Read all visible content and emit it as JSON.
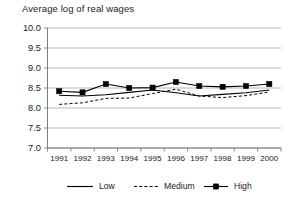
{
  "chart_data": {
    "type": "line",
    "title": "Average log of real wages",
    "xlabel": "",
    "ylabel": "",
    "categories": [
      "1991",
      "1992",
      "1993",
      "1994",
      "1995",
      "1996",
      "1997",
      "1998",
      "1999",
      "2000"
    ],
    "x": [
      1991,
      1992,
      1993,
      1994,
      1995,
      1996,
      1997,
      1998,
      1999,
      2000
    ],
    "ylim": [
      7.0,
      10.0
    ],
    "ytick_labels": [
      "10.0",
      "9.5",
      "9.0",
      "8.5",
      "8.0",
      "7.5",
      "7.0"
    ],
    "ytick_values": [
      10.0,
      9.5,
      9.0,
      8.5,
      8.0,
      7.5,
      7.0
    ],
    "grid": true,
    "legend_position": "bottom",
    "series": [
      {
        "name": "Low",
        "style": "solid",
        "marker": "none",
        "color": "#000000",
        "values": [
          8.32,
          8.3,
          8.33,
          8.39,
          8.45,
          8.38,
          8.3,
          8.34,
          8.38,
          8.45
        ]
      },
      {
        "name": "Medium",
        "style": "dashed",
        "marker": "none",
        "color": "#000000",
        "values": [
          8.09,
          8.13,
          8.24,
          8.25,
          8.36,
          8.47,
          8.3,
          8.26,
          8.31,
          8.4
        ]
      },
      {
        "name": "High",
        "style": "solid",
        "marker": "square",
        "color": "#000000",
        "values": [
          8.42,
          8.39,
          8.6,
          8.5,
          8.51,
          8.65,
          8.55,
          8.53,
          8.55,
          8.6
        ]
      }
    ]
  },
  "legend": {
    "items": [
      {
        "label": "Low"
      },
      {
        "label": "Medium"
      },
      {
        "label": "High"
      }
    ]
  }
}
